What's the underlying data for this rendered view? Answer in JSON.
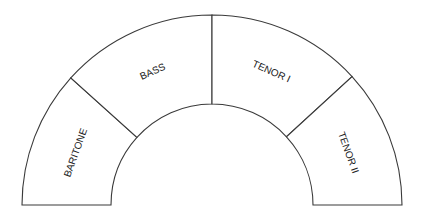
{
  "diagram": {
    "title": "",
    "type": "choir-seating-arc",
    "sections": [
      {
        "id": "baritone",
        "label": "BARITONE"
      },
      {
        "id": "bass",
        "label": "BASS"
      },
      {
        "id": "tenor-1",
        "label": "TENOR I"
      },
      {
        "id": "tenor-2",
        "label": "TENOR II"
      }
    ],
    "colors": {
      "line": "#3a3a3a",
      "fill": "#ffffff",
      "text": "#222222"
    }
  }
}
